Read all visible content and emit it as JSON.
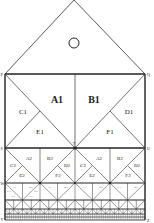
{
  "diagram": {
    "type": "recursive-subdivision-figure",
    "roof": {
      "symbol": "circle"
    },
    "corner_labels": {
      "top_left": "P",
      "top_right": "Q",
      "level1_bottom_left": "S",
      "level1_bottom_right": "U",
      "level1_center": "T",
      "level2_bottom_left": "W",
      "bottom_left": "Y",
      "bottom_right": "Z"
    },
    "level1": {
      "A": "A1",
      "B": "B1",
      "C": "C1",
      "D": "D1",
      "E": "E1",
      "F": "F1"
    },
    "level2": {
      "A": "A2",
      "B": "B2",
      "C": "C2",
      "D": "D2",
      "E": "E2",
      "F": "F2"
    },
    "level3": {
      "A": "A3",
      "B": "B3",
      "C": "C3",
      "D": "D3",
      "E": "E3",
      "F": "F3"
    },
    "colors": {
      "line": "#222222",
      "background": "#ffffff"
    }
  }
}
